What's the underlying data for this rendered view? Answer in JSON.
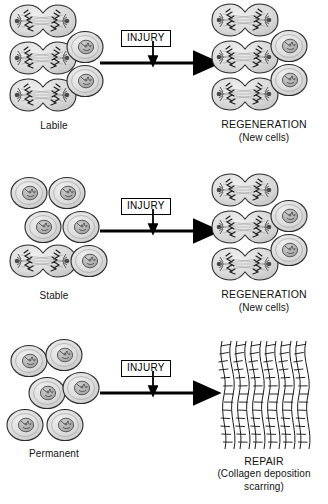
{
  "figure": {
    "injury_label": "INJURY",
    "arrow_color": "#000000",
    "cell_fill": "#d9d9d9",
    "cell_stroke": "#2b2b2b",
    "nucleus_fill": "#b3b3b3",
    "collagen_fill": "#ffffff",
    "collagen_stroke": "#1a1a1a"
  },
  "rows": [
    {
      "id": "labile",
      "left_label": "Labile",
      "left_cells": {
        "dividing": 3,
        "round": 2
      },
      "injury_label": "INJURY",
      "right_label": "REGENERATION",
      "right_sublabel": "(New cells)",
      "right_cells": {
        "dividing": 3,
        "round": 2
      },
      "outcome": "regeneration"
    },
    {
      "id": "stable",
      "left_label": "Stable",
      "left_cells": {
        "dividing": 1,
        "round": 5
      },
      "injury_label": "INJURY",
      "right_label": "REGENERATION",
      "right_sublabel": "(New cells)",
      "right_cells": {
        "dividing": 3,
        "round": 2
      },
      "outcome": "regeneration"
    },
    {
      "id": "permanent",
      "left_label": "Permanent",
      "left_cells": {
        "dividing": 0,
        "round": 6
      },
      "injury_label": "INJURY",
      "right_label": "REPAIR",
      "right_sublabel": "(Collagen deposition",
      "right_sublabel2": "scarring)",
      "right_cells": {
        "collagen_fibers": 6
      },
      "outcome": "repair"
    }
  ]
}
